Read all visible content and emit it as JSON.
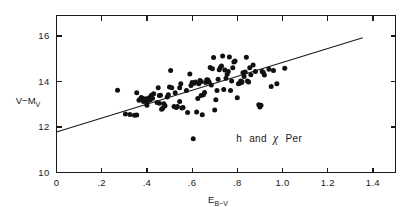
{
  "chart_data": {
    "type": "scatter",
    "title_parts": {
      "h": "h",
      "and": "and",
      "chi": "χ",
      "per": "Per"
    },
    "xlabel": "E_B-V",
    "xlabel_parts": {
      "main": "E",
      "sub": "B−V"
    },
    "ylabel": "V−M_V",
    "ylabel_parts": {
      "main": "V−M",
      "sub": "V"
    },
    "xlim": [
      0,
      1.5
    ],
    "ylim": [
      16.9,
      10
    ],
    "y_inverted": true,
    "grid": false,
    "legend": false,
    "xticks": [
      0,
      0.2,
      0.4,
      0.6,
      0.8,
      1.0,
      1.2,
      1.4
    ],
    "xtick_labels": [
      "0",
      ".2",
      ".4",
      ".6",
      ".8",
      "1.0",
      "1.2",
      "1.4"
    ],
    "yticks": [
      10,
      12,
      14,
      16
    ],
    "ytick_labels": [
      "10",
      "12",
      "14",
      "16"
    ],
    "point_color": "#111111",
    "line_color": "#1a1a1a",
    "axis_color": "#1a1a1a",
    "marker_size": 2.5,
    "fit_line": {
      "label": "linear fit",
      "x": [
        0.0,
        1.355
      ],
      "y": [
        11.78,
        15.92
      ]
    },
    "points": [
      [
        0.27,
        13.62
      ],
      [
        0.305,
        12.57
      ],
      [
        0.325,
        12.55
      ],
      [
        0.345,
        12.52
      ],
      [
        0.355,
        12.53
      ],
      [
        0.365,
        13.18
      ],
      [
        0.37,
        13.22
      ],
      [
        0.375,
        13.3
      ],
      [
        0.38,
        13.26
      ],
      [
        0.385,
        13.12
      ],
      [
        0.39,
        13.2
      ],
      [
        0.395,
        13.24
      ],
      [
        0.4,
        13.08
      ],
      [
        0.4,
        12.96
      ],
      [
        0.405,
        13.18
      ],
      [
        0.41,
        13.28
      ],
      [
        0.415,
        13.2
      ],
      [
        0.42,
        13.4
      ],
      [
        0.425,
        13.26
      ],
      [
        0.43,
        13.46
      ],
      [
        0.355,
        13.5
      ],
      [
        0.45,
        13.72
      ],
      [
        0.455,
        13.38
      ],
      [
        0.46,
        13.4
      ],
      [
        0.465,
        12.78
      ],
      [
        0.47,
        12.82
      ],
      [
        0.475,
        13.02
      ],
      [
        0.48,
        12.93
      ],
      [
        0.49,
        13.32
      ],
      [
        0.495,
        13.42
      ],
      [
        0.5,
        13.76
      ],
      [
        0.505,
        14.48
      ],
      [
        0.51,
        13.72
      ],
      [
        0.52,
        12.9
      ],
      [
        0.525,
        13.5
      ],
      [
        0.53,
        12.86
      ],
      [
        0.535,
        12.9
      ],
      [
        0.545,
        13.72
      ],
      [
        0.55,
        13.9
      ],
      [
        0.555,
        12.83
      ],
      [
        0.56,
        12.86
      ],
      [
        0.575,
        13.6
      ],
      [
        0.58,
        12.64
      ],
      [
        0.59,
        14.33
      ],
      [
        0.595,
        13.82
      ],
      [
        0.6,
        13.95
      ],
      [
        0.605,
        11.48
      ],
      [
        0.61,
        13.92
      ],
      [
        0.615,
        13.98
      ],
      [
        0.62,
        12.66
      ],
      [
        0.625,
        13.25
      ],
      [
        0.63,
        13.9
      ],
      [
        0.635,
        14.04
      ],
      [
        0.64,
        14.0
      ],
      [
        0.645,
        12.54
      ],
      [
        0.65,
        13.42
      ],
      [
        0.655,
        13.52
      ],
      [
        0.66,
        13.96
      ],
      [
        0.665,
        14.08
      ],
      [
        0.67,
        14.06
      ],
      [
        0.675,
        13.98
      ],
      [
        0.68,
        14.62
      ],
      [
        0.685,
        13.85
      ],
      [
        0.69,
        14.56
      ],
      [
        0.695,
        15.05
      ],
      [
        0.7,
        12.75
      ],
      [
        0.705,
        13.2
      ],
      [
        0.71,
        13.6
      ],
      [
        0.715,
        14.1
      ],
      [
        0.72,
        14.52
      ],
      [
        0.725,
        14.62
      ],
      [
        0.73,
        14.68
      ],
      [
        0.735,
        15.12
      ],
      [
        0.74,
        13.65
      ],
      [
        0.745,
        14.5
      ],
      [
        0.75,
        14.14
      ],
      [
        0.755,
        14.32
      ],
      [
        0.76,
        14.44
      ],
      [
        0.765,
        15.08
      ],
      [
        0.77,
        13.6
      ],
      [
        0.775,
        14.02
      ],
      [
        0.78,
        14.6
      ],
      [
        0.785,
        14.86
      ],
      [
        0.79,
        14.9
      ],
      [
        0.8,
        13.28
      ],
      [
        0.805,
        13.9
      ],
      [
        0.81,
        13.92
      ],
      [
        0.815,
        14.02
      ],
      [
        0.82,
        14.0
      ],
      [
        0.825,
        14.38
      ],
      [
        0.83,
        14.22
      ],
      [
        0.835,
        14.42
      ],
      [
        0.84,
        15.06
      ],
      [
        0.845,
        14.02
      ],
      [
        0.85,
        13.98
      ],
      [
        0.855,
        14.6
      ],
      [
        0.86,
        14.3
      ],
      [
        0.87,
        14.72
      ],
      [
        0.88,
        14.44
      ],
      [
        0.895,
        12.98
      ],
      [
        0.9,
        12.88
      ],
      [
        0.905,
        12.96
      ],
      [
        0.91,
        14.44
      ],
      [
        0.915,
        14.4
      ],
      [
        0.92,
        14.28
      ],
      [
        0.94,
        14.54
      ],
      [
        0.95,
        13.78
      ],
      [
        0.96,
        14.48
      ],
      [
        0.975,
        13.9
      ],
      [
        1.01,
        14.58
      ],
      [
        0.455,
        13.04
      ],
      [
        0.445,
        13.08
      ],
      [
        0.64,
        13.38
      ],
      [
        0.545,
        13.12
      ],
      [
        0.82,
        13.96
      ]
    ]
  }
}
